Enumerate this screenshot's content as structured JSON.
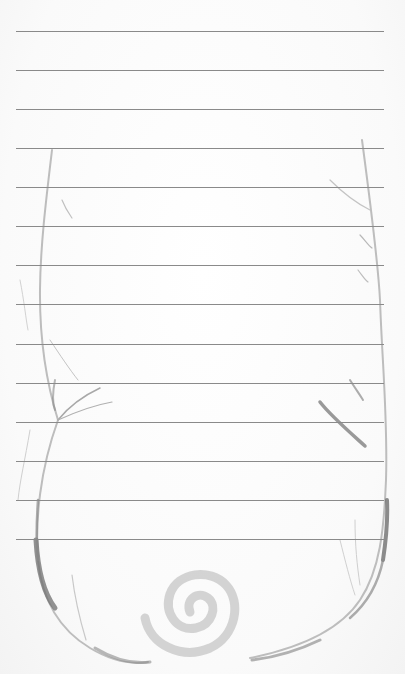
{
  "paper": {
    "type": "lined-notepaper",
    "background": "#fbfbfb",
    "rule_color": "#8a8a8a",
    "rule_left": 16,
    "rule_width": 368,
    "rules_y": [
      31,
      70,
      109,
      148,
      187,
      226,
      265,
      304,
      344,
      383,
      422,
      461,
      500,
      539
    ]
  },
  "decoration": {
    "icons": [
      "vine-left-icon",
      "vine-right-icon",
      "spiral-icon"
    ],
    "vine_color": "#6f6f6f",
    "spiral_color": "#c9c9c9"
  }
}
